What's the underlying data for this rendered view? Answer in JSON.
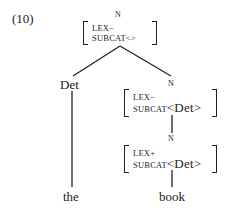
{
  "example_number": "(10)",
  "tree": {
    "root": {
      "category": "N",
      "features": {
        "lex_label": "LEX",
        "lex_value": "−",
        "subcat_label": "SUBCAT",
        "subcat_value": "<>"
      }
    },
    "left_child": {
      "category": "Det",
      "word": "the"
    },
    "right_child": {
      "category": "N",
      "features": {
        "lex_label": "LEX",
        "lex_value": "−",
        "subcat_label": "SUBCAT",
        "subcat_value": "<Det>"
      },
      "child": {
        "category": "N",
        "features": {
          "lex_label": "LEX",
          "lex_value": "+",
          "subcat_label": "SUBCAT",
          "subcat_value": "<Det>"
        },
        "word": "book"
      }
    }
  }
}
